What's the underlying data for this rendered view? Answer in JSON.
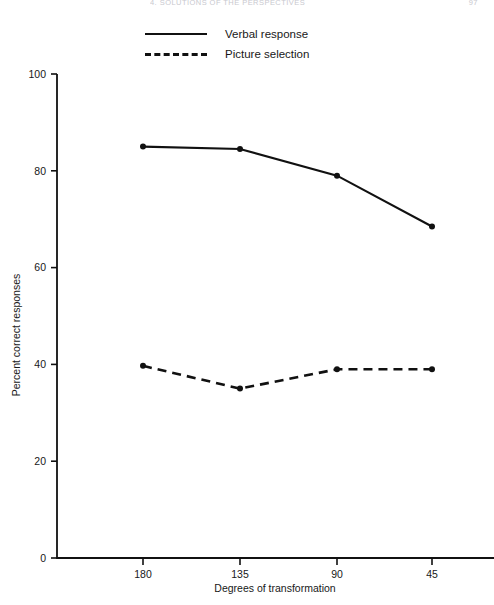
{
  "header": {
    "title": "4.  SOLUTIONS OF THE PERSPECTIVES",
    "page_number": "97"
  },
  "legend": {
    "position": "top-left",
    "entries": [
      {
        "label": "Verbal response",
        "style": "solid"
      },
      {
        "label": "Picture selection",
        "style": "dashed"
      }
    ]
  },
  "chart_data": {
    "type": "line",
    "title": "",
    "xlabel": "Degrees of transformation",
    "ylabel": "Percent correct responses",
    "categories": [
      "180",
      "135",
      "90",
      "45"
    ],
    "xlim": [
      0,
      5
    ],
    "ylim": [
      0,
      100
    ],
    "yticks": [
      0,
      20,
      40,
      60,
      80,
      100
    ],
    "ytick_labels": [
      "0",
      "20",
      "40",
      "60",
      "80",
      "100"
    ],
    "grid": false,
    "legend_position": "top-left",
    "series": [
      {
        "name": "Verbal response",
        "style": "solid",
        "marker": "filled-circle",
        "values": [
          85.0,
          84.5,
          79.0,
          68.5
        ]
      },
      {
        "name": "Picture selection",
        "style": "dashed",
        "marker": "filled-circle",
        "values": [
          39.7,
          35.0,
          39.0,
          39.0
        ]
      }
    ]
  }
}
